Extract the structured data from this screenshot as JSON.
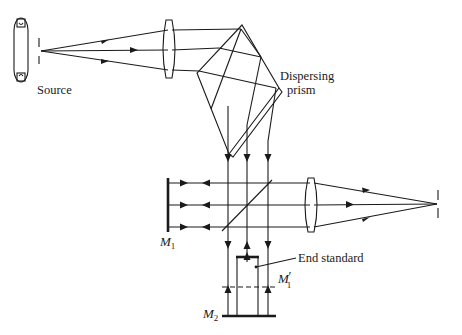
{
  "figure": {
    "labels": {
      "source": "Source",
      "prism_line1": "Dispersing",
      "prism_line2": "prism",
      "end_standard": "End standard",
      "m1_letter": "M",
      "m1_sub": "1",
      "m1p_letter": "M",
      "m1p_prime": "′",
      "m1p_sub": "1",
      "m2_letter": "M",
      "m2_sub": "2"
    },
    "components": [
      {
        "id": "source-lamp",
        "type": "lamp"
      },
      {
        "id": "entrance-slit",
        "type": "slit"
      },
      {
        "id": "collimating-lens",
        "type": "lens"
      },
      {
        "id": "dispersing-prism",
        "type": "prism"
      },
      {
        "id": "beam-splitter",
        "type": "plate"
      },
      {
        "id": "mirror-m1",
        "type": "mirror"
      },
      {
        "id": "mirror-m2",
        "type": "mirror"
      },
      {
        "id": "end-standard",
        "type": "gauge-block"
      },
      {
        "id": "reference-plane-m1-prime",
        "type": "virtual-mirror"
      },
      {
        "id": "imaging-lens",
        "type": "lens"
      },
      {
        "id": "exit-slit",
        "type": "slit"
      }
    ],
    "colors": {
      "stroke": "#1a1a1a",
      "background": "#ffffff"
    }
  }
}
